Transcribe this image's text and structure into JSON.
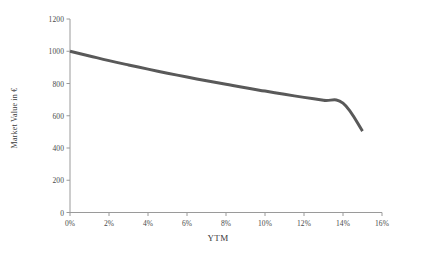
{
  "chart_data": {
    "type": "line",
    "title": "",
    "subtitle": "",
    "xlabel": "YTM",
    "ylabel": "Market Value in €",
    "xlim": [
      0,
      16
    ],
    "ylim": [
      0,
      1200
    ],
    "xtick_labels": [
      "0%",
      "2%",
      "4%",
      "6%",
      "8%",
      "10%",
      "12%",
      "14%",
      "16%"
    ],
    "xtick_values": [
      0,
      2,
      4,
      6,
      8,
      10,
      12,
      14,
      16
    ],
    "ytick_labels": [
      "0",
      "200",
      "400",
      "600",
      "800",
      "1000",
      "1200"
    ],
    "ytick_values": [
      0,
      200,
      400,
      600,
      800,
      1000,
      1200
    ],
    "grid": false,
    "legend": false,
    "legend_position": "none",
    "line_color": "#595959",
    "line_width": 3,
    "axis_color": "#9a9a9a",
    "x": [
      0,
      1,
      2,
      3,
      4,
      5,
      6,
      7,
      8,
      9,
      10,
      11,
      12,
      13,
      14,
      15
    ],
    "series": [
      {
        "name": "Market Value",
        "values": [
          1000,
          971,
          942,
          915,
          889,
          864,
          840,
          817,
          795,
          773,
          753,
          733,
          714,
          696,
          678,
          505
        ]
      }
    ],
    "annotations": []
  },
  "axis": {
    "x_title": "YTM",
    "y_title": "Market Value in €"
  }
}
